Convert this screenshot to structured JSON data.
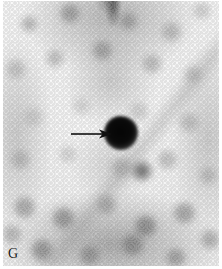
{
  "figure": {
    "panel_label": "G",
    "modality": "planar radionuclide scintigram",
    "orientation": "anterior",
    "background_color": "#ffffff",
    "scan_tone_light": "#f7f7f7",
    "scan_tone_mid": "#9a9a9a",
    "scan_tone_dark": "#0a0a0a"
  },
  "findings": {
    "hot_nodule": {
      "name": "focal intense radiotracer uptake",
      "color": "#0a0a0a",
      "center_x": 118,
      "center_y": 133,
      "diameter_px": 34
    },
    "secondary_focus": {
      "name": "faint secondary uptake focus",
      "color": "#3c3c3c",
      "center_x": 139,
      "center_y": 171,
      "diameter_px": 23
    },
    "midline_stripe": {
      "name": "superior midline activity band",
      "color": "#4a4a4a"
    }
  },
  "annotation": {
    "arrow": {
      "name": "pointer-arrow",
      "color": "#111111",
      "direction": "right",
      "shaft_start_x": 71,
      "shaft_end_x": 101,
      "tip_x": 108,
      "y": 134,
      "shaft_thickness_px": 1.6
    }
  }
}
